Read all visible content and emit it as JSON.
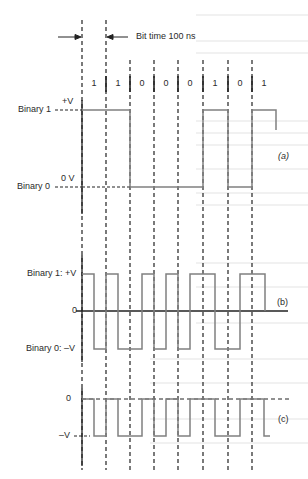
{
  "figure": {
    "bit_time_label": "Bit time 100 ns",
    "bits": [
      "1",
      "1",
      "0",
      "0",
      "0",
      "1",
      "0",
      "1"
    ],
    "panel_a": {
      "tag": "(a)",
      "high_label_name": "Binary 1",
      "high_label_level": "+V",
      "low_label_name": "Binary 0",
      "low_label_level": "0 V"
    },
    "panel_b": {
      "tag": "(b)",
      "high_label": "Binary 1: +V",
      "zero_label": "0",
      "low_label": "Binary 0: –V"
    },
    "panel_c": {
      "tag": "(c)",
      "zero_label": "0",
      "low_label": "–V"
    },
    "colors": {
      "waveform": "#808080",
      "axis": "#222222",
      "dashed": "#222222",
      "text": "#2a2a2a"
    }
  }
}
